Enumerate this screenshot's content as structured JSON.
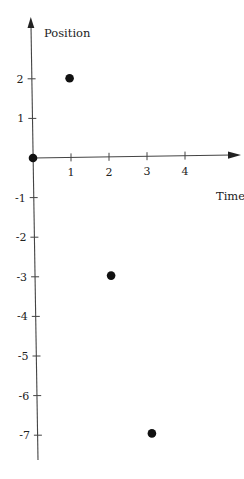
{
  "chart_data": {
    "type": "scatter",
    "title": "",
    "xlabel": "Time",
    "ylabel": "Position",
    "x_ticks": [
      1,
      2,
      3,
      4
    ],
    "y_ticks": [
      2,
      1,
      -1,
      -2,
      -3,
      -4,
      -5,
      -6,
      -7
    ],
    "xlim": [
      0,
      5
    ],
    "ylim": [
      -8,
      3
    ],
    "grid": false,
    "legend": null,
    "points": [
      {
        "x": 0,
        "y": 0
      },
      {
        "x": 1,
        "y": 2
      },
      {
        "x": 2,
        "y": -3
      },
      {
        "x": 3,
        "y": -7
      }
    ],
    "colors": {
      "axis": "#333333",
      "point": "#111111"
    }
  },
  "labels": {
    "xlabel": "Time",
    "ylabel": "Position",
    "x_tick_labels": [
      "1",
      "2",
      "3",
      "4"
    ],
    "y_tick_labels": [
      "2",
      "1",
      "-1",
      "-2",
      "-3",
      "-4",
      "-5",
      "-6",
      "-7"
    ]
  }
}
